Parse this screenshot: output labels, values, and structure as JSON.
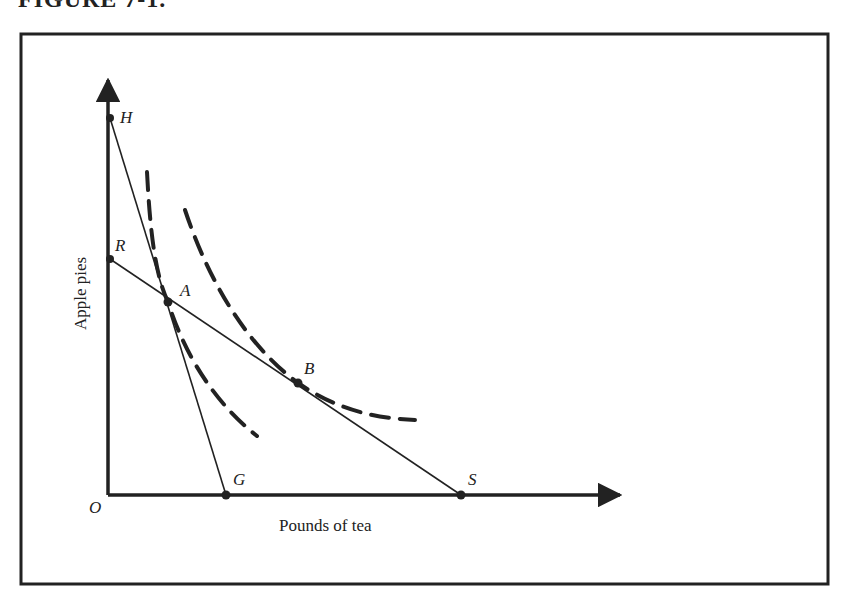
{
  "figure": {
    "title": "FIGURE 7-1."
  },
  "axes": {
    "x_label": "Pounds of tea",
    "y_label": "Apple pies",
    "origin_label": "O"
  },
  "points": {
    "H": "H",
    "R": "R",
    "A": "A",
    "B": "B",
    "G": "G",
    "S": "S"
  },
  "lines": [
    {
      "name": "budget-line-HG",
      "from": "H",
      "to": "G",
      "style": "solid"
    },
    {
      "name": "budget-line-RS",
      "from": "R",
      "to": "S",
      "style": "solid"
    }
  ],
  "curves": [
    {
      "name": "indifference-curve-1",
      "through": "A",
      "style": "dashed"
    },
    {
      "name": "indifference-curve-2",
      "through": "B",
      "style": "dashed"
    }
  ],
  "colors": {
    "ink": "#222222",
    "background": "#ffffff"
  }
}
